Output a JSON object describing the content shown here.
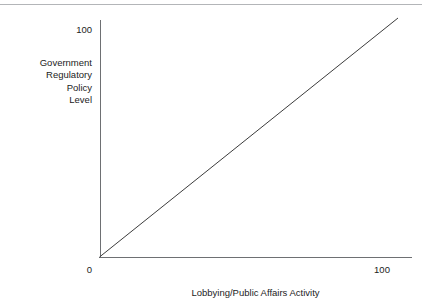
{
  "chart_data": {
    "type": "line",
    "title": "",
    "subtitle": "",
    "xlabel": "Lobbying/Public Affairs Activity",
    "ylabel": "Government Regulatory Policy Level",
    "ylabel_lines": [
      "Government",
      "Regulatory",
      "Policy",
      "Level"
    ],
    "xlim": [
      0,
      100
    ],
    "ylim": [
      0,
      100
    ],
    "x_ticks": [
      0,
      100
    ],
    "x_tick_labels": [
      "0",
      "100"
    ],
    "y_ticks": [
      100
    ],
    "y_tick_labels": [
      "100"
    ],
    "grid": false,
    "legend": null,
    "annotations": [],
    "series": [
      {
        "name": "",
        "x": [
          0,
          100
        ],
        "y": [
          0,
          100
        ],
        "color": "#3c3c3c",
        "line_width": 1,
        "style": "solid",
        "description": "straight positively sloped 45 degree line from origin to upper right"
      }
    ]
  },
  "figure": {
    "background_color": "#ffffff",
    "axis_color": "#6e7073",
    "text_color": "#1c1c1c",
    "rule_color": "#b3b5b8"
  }
}
